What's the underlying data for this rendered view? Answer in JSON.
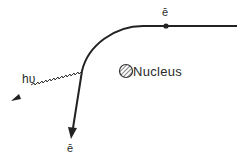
{
  "diagram": {
    "labels": {
      "electron_incoming": "ē",
      "electron_outgoing": "ē",
      "photon": "hυ",
      "nucleus": "Nucleus"
    },
    "colors": {
      "line": "#222222",
      "background": "#ffffff"
    }
  }
}
